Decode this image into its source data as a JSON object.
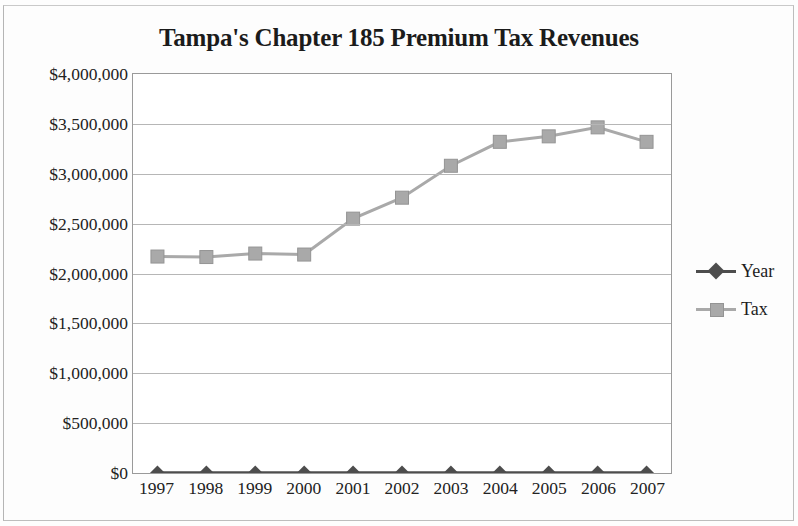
{
  "chart_data": {
    "type": "line",
    "title": "Tampa's Chapter 185 Premium Tax Revenues",
    "xlabel": "",
    "ylabel": "",
    "categories": [
      "1997",
      "1998",
      "1999",
      "2000",
      "2001",
      "2002",
      "2003",
      "2004",
      "2005",
      "2006",
      "2007"
    ],
    "series": [
      {
        "name": "Year",
        "marker": "diamond",
        "color": "#4d4d4d",
        "values": [
          0,
          0,
          0,
          0,
          0,
          0,
          0,
          0,
          0,
          0,
          0
        ]
      },
      {
        "name": "Tax",
        "marker": "square",
        "color": "#a9a9a9",
        "values": [
          2170000,
          2165000,
          2200000,
          2190000,
          2550000,
          2760000,
          3080000,
          3320000,
          3375000,
          3465000,
          3320000
        ]
      }
    ],
    "ylim": [
      0,
      4000000
    ],
    "ytick_values": [
      4000000,
      3500000,
      3000000,
      2500000,
      2000000,
      1500000,
      1000000,
      500000,
      0
    ],
    "ytick_labels": [
      "$4,000,000",
      "$3,500,000",
      "$3,000,000",
      "$2,500,000",
      "$2,000,000",
      "$1,500,000",
      "$1,000,000",
      "$500,000",
      "$0"
    ],
    "grid": true,
    "legend_position": "right",
    "legend": [
      "Year",
      "Tax"
    ]
  },
  "colors": {
    "series_year": "#4d4d4d",
    "series_tax": "#a9a9a9",
    "gridline": "#b6b6b6",
    "plot_border": "#9a9a9a",
    "text": "#222222"
  }
}
